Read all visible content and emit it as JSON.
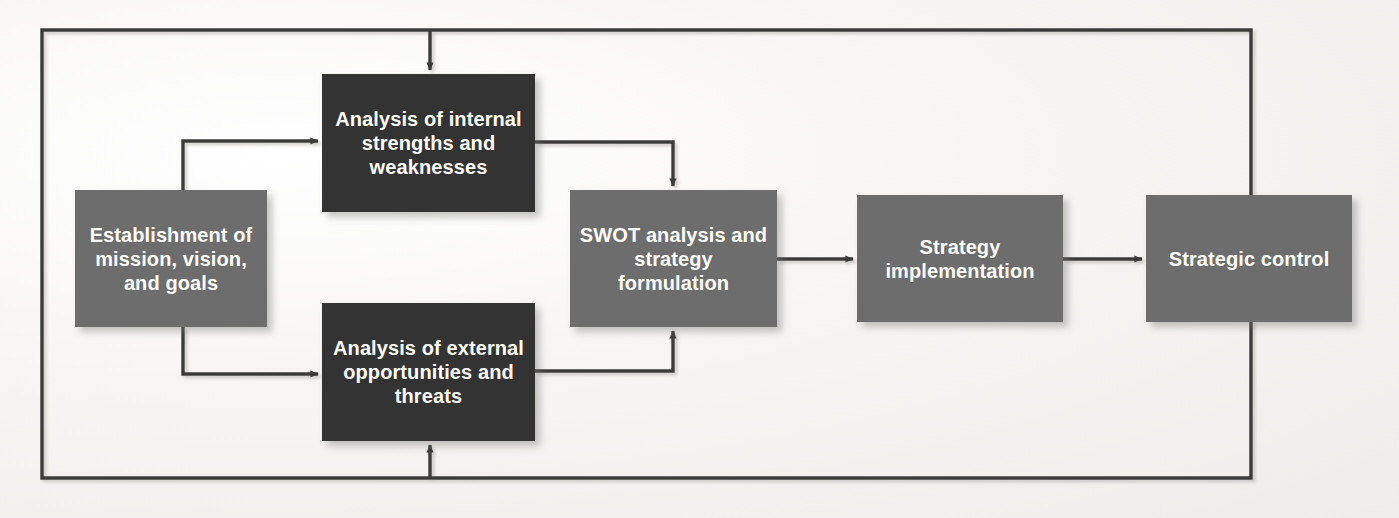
{
  "diagram": {
    "type": "flowchart",
    "colors": {
      "dark_box": "#333333",
      "medium_box": "#6d6d6d",
      "connector": "#3a3a3a",
      "background": "#f4f3f1",
      "box_text": "#ffffff"
    },
    "nodes": [
      {
        "id": "establishment",
        "label": "Establishment of mission, vision, and goals",
        "shade": "medium",
        "x": 75,
        "y": 190,
        "w": 192,
        "h": 137,
        "font_size": 20
      },
      {
        "id": "internal-analysis",
        "label": "Analysis of internal strengths and weaknesses",
        "shade": "dark",
        "x": 322,
        "y": 74,
        "w": 213,
        "h": 138,
        "font_size": 20
      },
      {
        "id": "external-analysis",
        "label": "Analysis of external opportunities and threats",
        "shade": "dark",
        "x": 322,
        "y": 303,
        "w": 213,
        "h": 138,
        "font_size": 20
      },
      {
        "id": "swot",
        "label": "SWOT analysis and strategy formulation",
        "shade": "medium",
        "x": 570,
        "y": 190,
        "w": 207,
        "h": 137,
        "font_size": 20
      },
      {
        "id": "strategy-implementation",
        "label": "Strategy implementation",
        "shade": "medium",
        "x": 857,
        "y": 195,
        "w": 206,
        "h": 127,
        "font_size": 20
      },
      {
        "id": "strategic-control",
        "label": "Strategic control",
        "shade": "medium",
        "x": 1146,
        "y": 195,
        "w": 206,
        "h": 127,
        "font_size": 20
      }
    ],
    "connectors": [
      {
        "id": "establishment-to-internal",
        "from": "establishment",
        "to": "internal-analysis",
        "style": "elbow-up",
        "arrow": true
      },
      {
        "id": "establishment-to-external",
        "from": "establishment",
        "to": "external-analysis",
        "style": "elbow-down",
        "arrow": true
      },
      {
        "id": "internal-to-swot",
        "from": "internal-analysis",
        "to": "swot",
        "style": "elbow-down-right",
        "arrow": true
      },
      {
        "id": "external-to-swot",
        "from": "external-analysis",
        "to": "swot",
        "style": "elbow-up-right",
        "arrow": true
      },
      {
        "id": "swot-to-implementation",
        "from": "swot",
        "to": "strategy-implementation",
        "style": "straight",
        "arrow": true
      },
      {
        "id": "implementation-to-control",
        "from": "strategy-implementation",
        "to": "strategic-control",
        "style": "straight",
        "arrow": true
      },
      {
        "id": "control-feedback-top",
        "from": "strategic-control",
        "to": "internal-analysis",
        "style": "feedback-loop-top",
        "arrow": true
      },
      {
        "id": "control-feedback-bottom",
        "from": "strategic-control",
        "to": "external-analysis",
        "style": "feedback-loop-bottom",
        "arrow": true
      }
    ]
  }
}
